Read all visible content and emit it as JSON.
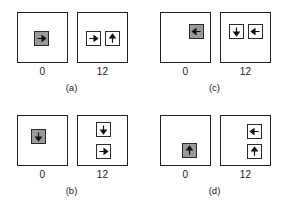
{
  "figure": {
    "layout": "2x2 grid of panels",
    "tick_labels": [
      "0",
      "12"
    ],
    "colors": {
      "fill_gray": "#9a9a9a",
      "stroke": "#2b2b2b",
      "frame": "#222222",
      "background": "#ffffff"
    }
  },
  "panels": [
    {
      "caption": "(a)",
      "tick_left": "0",
      "tick_right": "12",
      "left_box": {
        "cells": [
          {
            "kind": "gray",
            "arrow": "arrow-right-icon",
            "x": 16,
            "y": 18
          }
        ]
      },
      "right_box": {
        "cells": [
          {
            "kind": "white",
            "arrow": "arrow-right-icon",
            "x": 8,
            "y": 18
          },
          {
            "kind": "white",
            "arrow": "arrow-up-icon",
            "x": 27,
            "y": 18
          }
        ]
      }
    },
    {
      "caption": "(c)",
      "tick_left": "0",
      "tick_right": "12",
      "left_box": {
        "cells": [
          {
            "kind": "gray",
            "arrow": "arrow-left-icon",
            "x": 28,
            "y": 11
          }
        ]
      },
      "right_box": {
        "cells": [
          {
            "kind": "white",
            "arrow": "arrow-down-icon",
            "x": 8,
            "y": 11
          },
          {
            "kind": "white",
            "arrow": "arrow-left-icon",
            "x": 27,
            "y": 11
          }
        ]
      }
    },
    {
      "caption": "(b)",
      "tick_left": "0",
      "tick_right": "12",
      "left_box": {
        "cells": [
          {
            "kind": "gray",
            "arrow": "arrow-down-icon",
            "x": 13,
            "y": 13
          }
        ]
      },
      "right_box": {
        "cells": [
          {
            "kind": "white",
            "arrow": "arrow-down-icon",
            "x": 18,
            "y": 6
          },
          {
            "kind": "white",
            "arrow": "arrow-right-icon",
            "x": 18,
            "y": 28
          }
        ]
      }
    },
    {
      "caption": "(d)",
      "tick_left": "0",
      "tick_right": "12",
      "left_box": {
        "cells": [
          {
            "kind": "gray",
            "arrow": "arrow-up-icon",
            "x": 21,
            "y": 27
          }
        ]
      },
      "right_box": {
        "cells": [
          {
            "kind": "white",
            "arrow": "arrow-left-icon",
            "x": 26,
            "y": 8
          },
          {
            "kind": "white",
            "arrow": "arrow-up-icon",
            "x": 26,
            "y": 28
          }
        ]
      }
    }
  ]
}
